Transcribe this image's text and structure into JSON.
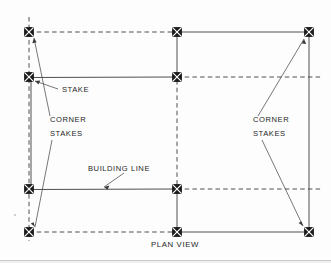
{
  "diagram": {
    "caption": "PLAN VIEW",
    "labels": {
      "stake": "STAKE",
      "corner_stakes_left_line1": "CORNER",
      "corner_stakes_left_line2": "STAKES",
      "corner_stakes_right_line1": "CORNER",
      "corner_stakes_right_line2": "STAKES",
      "building_line": "BUILDING LINE"
    },
    "colors": {
      "ink": "#262626",
      "line": "#3a3a3a",
      "stake_fill": "#1b1b1b",
      "paper": "#fdfdfd"
    },
    "stakes": [
      {
        "name": "stake-top-left",
        "x": 29,
        "y": 32
      },
      {
        "name": "stake-top-middle",
        "x": 177,
        "y": 32
      },
      {
        "name": "stake-top-right",
        "x": 309,
        "y": 32
      },
      {
        "name": "stake-upper-left",
        "x": 29,
        "y": 77
      },
      {
        "name": "stake-upper-middle",
        "x": 177,
        "y": 77
      },
      {
        "name": "stake-lower-left",
        "x": 29,
        "y": 189
      },
      {
        "name": "stake-lower-middle",
        "x": 177,
        "y": 189
      },
      {
        "name": "stake-bottom-left",
        "x": 29,
        "y": 232
      },
      {
        "name": "stake-bottom-middle",
        "x": 177,
        "y": 232
      },
      {
        "name": "stake-bottom-right",
        "x": 309,
        "y": 232
      }
    ],
    "grid": {
      "columns_x": [
        29,
        177,
        309
      ],
      "rows_y": [
        32,
        77,
        189,
        232
      ]
    }
  }
}
